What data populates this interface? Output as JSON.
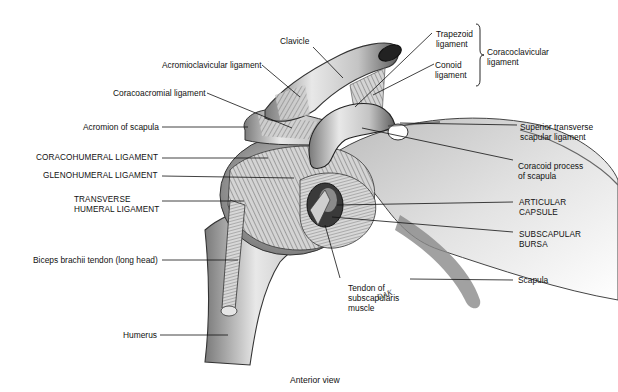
{
  "figure": {
    "caption": "Anterior view",
    "signature": "DAK"
  },
  "labels": {
    "clavicle": "Clavicle",
    "acromioclavicular": "Acromioclavicular ligament",
    "coracoacromial": "Coracoacromial ligament",
    "acromion": "Acromion of scapula",
    "coracohumeral": "CORACOHUMERAL LIGAMENT",
    "glenohumeral": "GLENOHUMERAL LIGAMENT",
    "transverse_humeral_1": "TRANSVERSE",
    "transverse_humeral_2": "HUMERAL LIGAMENT",
    "biceps": "Biceps brachii tendon (long head)",
    "humerus": "Humerus",
    "trapezoid_1": "Trapezoid",
    "trapezoid_2": "ligament",
    "conoid_1": "Conoid",
    "conoid_2": "ligament",
    "coracoclavicular_1": "Coracoclavicular",
    "coracoclavicular_2": "ligament",
    "superior_transverse_1": "Superior transverse",
    "superior_transverse_2": "scapular ligament",
    "coracoid_1": "Coracoid process",
    "coracoid_2": "of scapula",
    "articular_1": "ARTICULAR",
    "articular_2": "CAPSULE",
    "subscapular_1": "SUBSCAPULAR",
    "subscapular_2": "BURSA",
    "scapula": "Scapula",
    "tendon_1": "Tendon of",
    "tendon_2": "subscapularis",
    "tendon_3": "muscle"
  },
  "colors": {
    "bone_light": "#e6e6e6",
    "bone_mid": "#b5b5b5",
    "bone_dark": "#6e6e6e",
    "ink": "#111111",
    "background": "#ffffff"
  }
}
